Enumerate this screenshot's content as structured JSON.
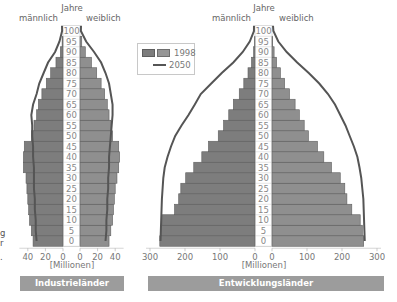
{
  "chart_data": [
    {
      "type": "bar",
      "subtype": "population-pyramid",
      "title": "Industrieländer",
      "xlabel": "[Millionen]",
      "ylabel": "Jahre",
      "left_label": "männlich",
      "right_label": "weiblich",
      "categories": [
        0,
        5,
        10,
        15,
        20,
        25,
        30,
        35,
        40,
        45,
        50,
        55,
        60,
        65,
        70,
        75,
        80,
        85,
        90,
        95,
        100
      ],
      "xlim": [
        0,
        45
      ],
      "xticks": [
        40,
        20,
        0,
        0,
        20,
        40
      ],
      "series": [
        {
          "name": "1998 männlich",
          "values": [
            34,
            36,
            38,
            39,
            40,
            41,
            42,
            45,
            45,
            44,
            36,
            33,
            30,
            28,
            24,
            19,
            14,
            8,
            3,
            1,
            0
          ]
        },
        {
          "name": "1998 weiblich",
          "values": [
            33,
            35,
            37,
            38,
            39,
            40,
            42,
            44,
            45,
            44,
            37,
            35,
            33,
            31,
            28,
            24,
            19,
            13,
            6,
            2,
            0
          ]
        },
        {
          "name": "2050 männlich",
          "values": [
            30,
            31,
            31,
            32,
            32,
            33,
            33,
            33,
            34,
            34,
            35,
            35,
            36,
            34,
            30,
            27,
            22,
            17,
            9,
            4,
            1
          ]
        },
        {
          "name": "2050 weiblich",
          "values": [
            29,
            30,
            30,
            31,
            31,
            32,
            32,
            33,
            33,
            34,
            35,
            36,
            37,
            37,
            35,
            33,
            29,
            24,
            16,
            7,
            1
          ]
        }
      ]
    },
    {
      "type": "bar",
      "subtype": "population-pyramid",
      "title": "Entwicklungsländer",
      "xlabel": "[Millionen]",
      "ylabel": "Jahre",
      "left_label": "männlich",
      "right_label": "weiblich",
      "categories": [
        0,
        5,
        10,
        15,
        20,
        25,
        30,
        35,
        40,
        45,
        50,
        55,
        60,
        65,
        70,
        75,
        80,
        85,
        90,
        95,
        100
      ],
      "xlim": [
        0,
        300
      ],
      "xticks": [
        300,
        200,
        100,
        0,
        0,
        100,
        200,
        300
      ],
      "series": [
        {
          "name": "1998 männlich",
          "values": [
            272,
            268,
            265,
            230,
            218,
            212,
            198,
            175,
            152,
            133,
            105,
            90,
            75,
            62,
            45,
            32,
            20,
            10,
            4,
            1,
            0
          ]
        },
        {
          "name": "1998 weiblich",
          "values": [
            262,
            258,
            252,
            228,
            214,
            208,
            195,
            170,
            148,
            130,
            104,
            92,
            78,
            66,
            50,
            36,
            24,
            13,
            6,
            2,
            0
          ]
        },
        {
          "name": "2050 männlich",
          "values": [
            270,
            269,
            268,
            267,
            266,
            264,
            262,
            258,
            250,
            240,
            228,
            210,
            190,
            172,
            155,
            125,
            95,
            62,
            35,
            15,
            3
          ]
        },
        {
          "name": "2050 weiblich",
          "values": [
            265,
            264,
            263,
            262,
            261,
            258,
            255,
            250,
            244,
            234,
            222,
            210,
            195,
            180,
            160,
            135,
            105,
            72,
            42,
            18,
            4
          ]
        }
      ]
    }
  ],
  "labels": {
    "years": "Jahre",
    "male": "männlich",
    "female": "weiblich",
    "unit": "[Millionen]",
    "ages": [
      "100",
      "95",
      "90",
      "85",
      "80",
      "75",
      "70",
      "65",
      "60",
      "55",
      "50",
      "45",
      "40",
      "35",
      "30",
      "25",
      "20",
      "15",
      "10",
      "5",
      "0"
    ]
  },
  "legend": {
    "item_1998": "1998",
    "item_2050": "2050",
    "swatch_male": "#7d7d7d",
    "swatch_female": "#969696",
    "line_color": "#555555"
  },
  "titles": {
    "left": "Industrieländer",
    "right": "Entwicklungsländer"
  },
  "left_ticks": [
    "40",
    "20",
    "0",
    "0",
    "20",
    "40"
  ],
  "right_ticks": [
    "300",
    "200",
    "100",
    "0",
    "0",
    "100",
    "200",
    "300"
  ],
  "clipped_text": [
    "g",
    "r",
    "."
  ],
  "colors": {
    "bar": "#8a8a8a",
    "bar_stroke": "#5e5e5e",
    "line": "#555555",
    "title_bar": "#9c9c9c"
  }
}
